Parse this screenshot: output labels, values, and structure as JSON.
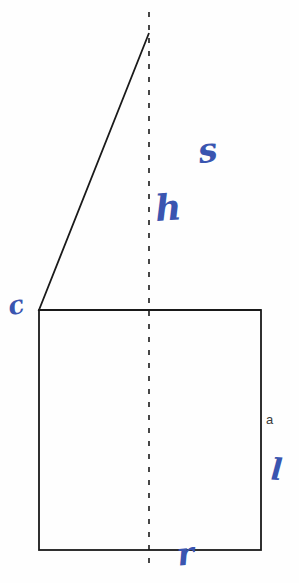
{
  "figure": {
    "canvas": {
      "width": 299,
      "height": 583,
      "background": "#fefefe"
    },
    "stroke_color": "#1a1a1a",
    "ink_color": "#3a55b0",
    "shapes": {
      "triangle": {
        "apex": {
          "x": 149,
          "y": 33
        },
        "left_base": {
          "x": 39,
          "y": 310
        },
        "right_base": {
          "x": 261,
          "y": 310
        },
        "stroke_width": 1.8
      },
      "rectangle": {
        "x": 39,
        "y": 310,
        "width": 222,
        "height": 240,
        "stroke_width": 1.8
      },
      "axis_of_symmetry": {
        "x": 149,
        "y_start": 12,
        "y_end": 568,
        "dash": "5 8",
        "stroke_width": 1.6
      }
    },
    "labels": {
      "side_a": {
        "text": "a",
        "kind": "printed",
        "x": 266,
        "y": 413
      }
    },
    "annotations": [
      {
        "id": "s",
        "text": "s",
        "kind": "handwritten",
        "color": "#3a55b0",
        "meaning": "slant-side-label",
        "x": 198,
        "y": 133
      },
      {
        "id": "h",
        "text": "h",
        "kind": "handwritten",
        "color": "#3a55b0",
        "meaning": "height-label",
        "x": 155,
        "y": 189
      },
      {
        "id": "c",
        "text": "c",
        "kind": "handwritten",
        "color": "#3a55b0",
        "meaning": "left-mark",
        "x": 8,
        "y": 292
      },
      {
        "id": "l",
        "text": "l",
        "kind": "handwritten",
        "color": "#3a55b0",
        "meaning": "right-mark",
        "x": 271,
        "y": 455
      },
      {
        "id": "r",
        "text": "r",
        "kind": "handwritten",
        "color": "#3a55b0",
        "meaning": "base-mark",
        "x": 177,
        "y": 538
      }
    ]
  }
}
